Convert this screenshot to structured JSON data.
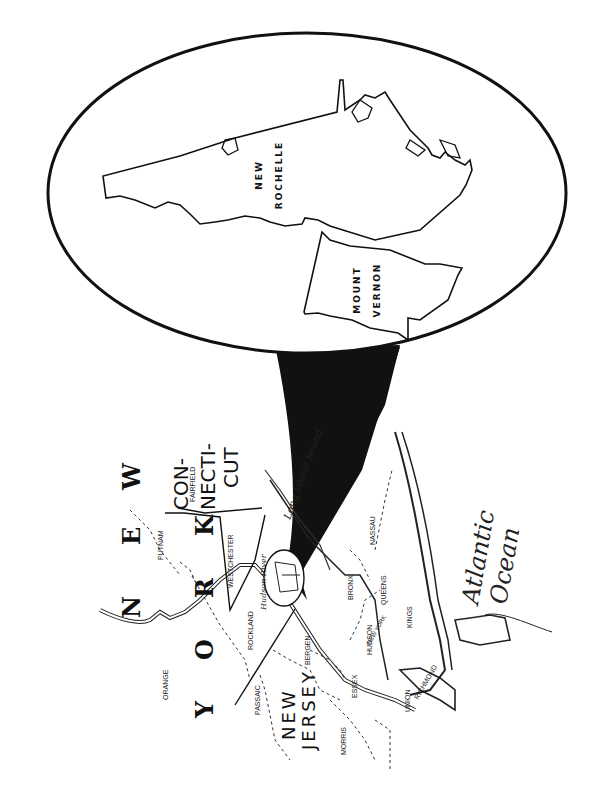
{
  "inset": {
    "cities": [
      {
        "name": "new-rochelle",
        "line1": "NEW",
        "line2": "ROCHELLE"
      },
      {
        "name": "mount-vernon",
        "line1": "MOUNT",
        "line2": "VERNON"
      }
    ]
  },
  "states": {
    "new_york_1": "N E W",
    "new_york_2": "Y O R K",
    "connecticut_1": "CON-",
    "connecticut_2": "NECTI-",
    "connecticut_3": "CUT",
    "new_jersey_1": "NEW",
    "new_jersey_2": "JERSEY"
  },
  "counties": {
    "orange": "ORANGE",
    "putnam": "PUTNAM",
    "rockland": "ROCKLAND",
    "westchester": "WESTCHESTER",
    "fairfield": "FAIRFIELD",
    "passaic": "PASSAIC",
    "bergen": "BERGEN",
    "morris": "MORRIS",
    "essex": "ESSEX",
    "hudson": "HUDSON",
    "union": "UNION",
    "bronx": "BRONX",
    "queens": "QUEENS",
    "kings": "KINGS",
    "nassau": "NASSAU",
    "richmond": "RICHMOND",
    "new_york": "NEW YORK"
  },
  "water": {
    "hudson_river": "Hudson River",
    "long_island_sound": "Long Island Sound",
    "atlantic_1": "Atlantic",
    "atlantic_2": "Ocean"
  },
  "colors": {
    "ink": "#111111",
    "paper": "#ffffff"
  }
}
